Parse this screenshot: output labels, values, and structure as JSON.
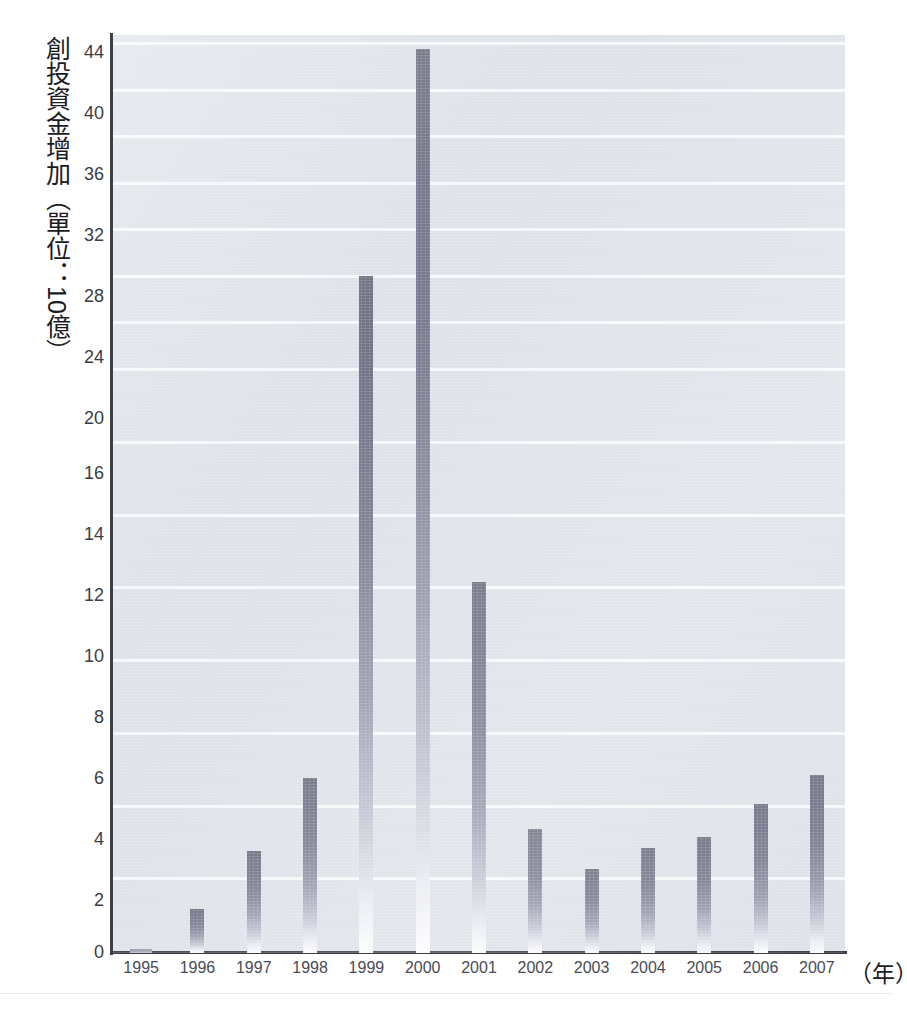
{
  "chart_data": {
    "type": "bar",
    "title": "",
    "subtitle": "",
    "ylabel": "創投資金增加（單位：10億）",
    "xlabel": "（年）",
    "categories": [
      "1995",
      "1996",
      "1997",
      "1998",
      "1999",
      "2000",
      "2001",
      "2002",
      "2003",
      "2004",
      "2005",
      "2006",
      "2007"
    ],
    "values": [
      0.1,
      1.2,
      2.8,
      4.8,
      24.2,
      43.7,
      10.2,
      3.4,
      2.3,
      2.9,
      3.2,
      4.1,
      4.9
    ],
    "series": [
      {
        "name": "創投資金增加",
        "values": [
          0.1,
          1.2,
          2.8,
          4.8,
          24.2,
          43.7,
          10.2,
          3.4,
          2.3,
          2.9,
          3.2,
          4.1,
          4.9
        ]
      }
    ],
    "ytick_labels": [
      "0",
      "2",
      "4",
      "6",
      "8",
      "10",
      "12",
      "14",
      "16",
      "20",
      "24",
      "28",
      "32",
      "36",
      "40",
      "44"
    ],
    "ytick_values": [
      0,
      2,
      4,
      6,
      8,
      10,
      12,
      14,
      16,
      20,
      24,
      28,
      32,
      36,
      40,
      44
    ],
    "ylim": [
      0,
      44
    ],
    "axis_note": "non-linear y-axis: 0-16 in steps of 2, 16-44 in steps of 4",
    "grid": true,
    "grid_color": "#f6f8fb",
    "legend": "none",
    "plot_background": "#dde2e9",
    "bar_color": "#74748a",
    "axis_color": "#3d3f47",
    "tick_label_color": "#3b3d44"
  },
  "footer": {
    "caption_fragment": ""
  }
}
